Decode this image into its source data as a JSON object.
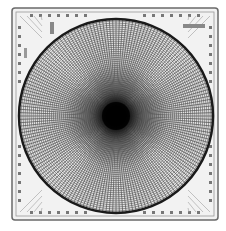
{
  "image": {
    "subject": "polar grid plate",
    "width": 226,
    "height": 231,
    "background": "#ffffff",
    "frame": {
      "x": 12,
      "y": 8,
      "w": 206,
      "h": 212,
      "stroke": "#6a6a6a",
      "fill": "#f2f2f2"
    },
    "circle": {
      "cx": 116,
      "cy": 116,
      "r": 97,
      "stroke": "#1a1a1a",
      "stroke_width": 2.5
    },
    "grid": {
      "radial_lines": 180,
      "concentric_rings": 48,
      "line_color": "#555555"
    },
    "center_blob": {
      "color": "#000000",
      "radius": 14
    },
    "labels": [
      {
        "position": "top-right",
        "text": ""
      },
      {
        "position": "top-left",
        "text": ""
      },
      {
        "position": "left",
        "text": ""
      }
    ]
  }
}
